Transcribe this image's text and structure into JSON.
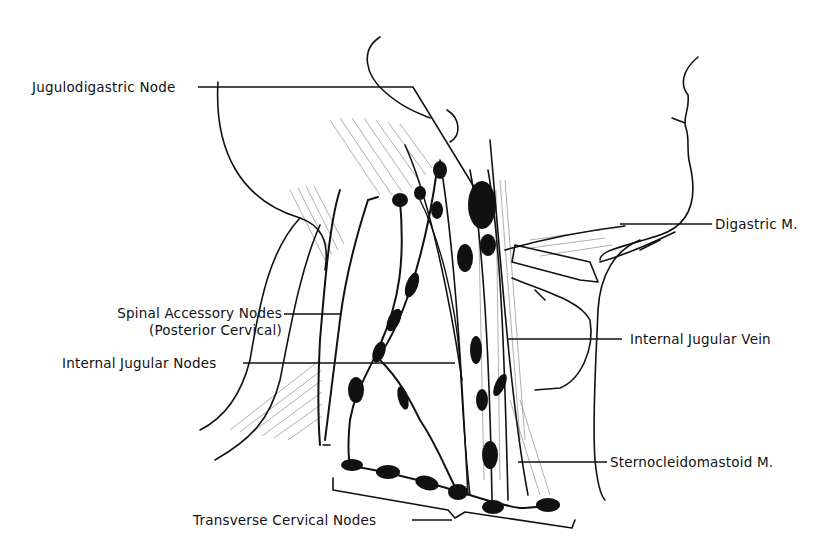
{
  "figure": {
    "background": "#ffffff",
    "ink": "#111111"
  },
  "labels": {
    "jugulodigastric_node": "Jugulodigastric Node",
    "spinal_accessory_line1": "Spinal Accessory Nodes",
    "spinal_accessory_line2": "(Posterior Cervical)",
    "internal_jugular_nodes": "Internal Jugular Nodes",
    "transverse_cervical_nodes": "Transverse Cervical Nodes",
    "digastric_m": "Digastric M.",
    "internal_jugular_vein": "Internal Jugular Vein",
    "sternocleidomastoid_m": "Sternocleidomastoid M."
  }
}
